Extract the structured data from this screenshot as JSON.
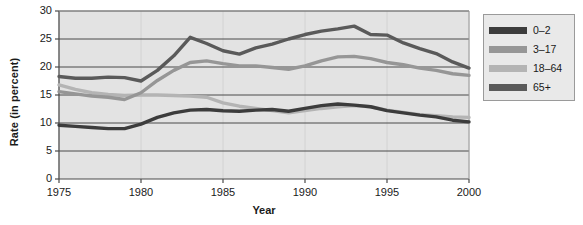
{
  "chart_data": {
    "type": "line",
    "title": "",
    "xlabel": "Year",
    "ylabel": "Rate (in percent)",
    "xlim": [
      1975,
      2000
    ],
    "ylim": [
      0,
      30
    ],
    "xticks": [
      1975,
      1980,
      1985,
      1990,
      1995,
      2000
    ],
    "yticks": [
      0,
      5,
      10,
      15,
      20,
      25,
      30
    ],
    "grid": "horizontal",
    "legend_position": "right",
    "x": [
      1975,
      1976,
      1977,
      1978,
      1979,
      1980,
      1981,
      1982,
      1983,
      1984,
      1985,
      1986,
      1987,
      1988,
      1989,
      1990,
      1991,
      1992,
      1993,
      1994,
      1995,
      1996,
      1997,
      1998,
      1999,
      2000
    ],
    "series": [
      {
        "name": "0-2",
        "color": "#3c3c3c",
        "values": [
          9.6,
          9.4,
          9.2,
          9.0,
          9.0,
          9.8,
          11.0,
          11.8,
          12.3,
          12.4,
          12.2,
          12.1,
          12.3,
          12.4,
          12.1,
          12.6,
          13.1,
          13.4,
          13.2,
          12.9,
          12.2,
          11.8,
          11.4,
          11.1,
          10.5,
          10.2
        ]
      },
      {
        "name": "3-17",
        "color": "#969696",
        "values": [
          15.6,
          15.2,
          14.8,
          14.6,
          14.2,
          15.4,
          17.6,
          19.4,
          20.8,
          21.1,
          20.6,
          20.2,
          20.2,
          19.9,
          19.6,
          20.2,
          21.1,
          21.8,
          21.9,
          21.5,
          20.8,
          20.4,
          19.8,
          19.4,
          18.8,
          18.5
        ]
      },
      {
        "name": "18-64",
        "color": "#b4b4b4",
        "values": [
          16.8,
          16.0,
          15.4,
          15.1,
          14.9,
          15.0,
          15.0,
          14.9,
          14.8,
          14.6,
          13.6,
          13.0,
          12.6,
          12.2,
          11.8,
          12.2,
          12.6,
          12.9,
          13.1,
          12.9,
          12.3,
          11.9,
          11.5,
          11.3,
          11.1,
          11.0
        ]
      },
      {
        "name": "65+",
        "color": "#5a5a5a",
        "values": [
          18.3,
          18.0,
          18.0,
          18.2,
          18.1,
          17.5,
          19.4,
          22.0,
          25.3,
          24.2,
          22.9,
          22.3,
          23.4,
          24.1,
          25.0,
          25.8,
          26.4,
          26.8,
          27.3,
          25.8,
          25.7,
          24.3,
          23.3,
          22.4,
          20.9,
          19.8
        ]
      }
    ]
  },
  "legend": {
    "items": [
      {
        "label": "0–2",
        "color": "#3c3c3c"
      },
      {
        "label": "3–17",
        "color": "#969696"
      },
      {
        "label": "18–64",
        "color": "#b4b4b4"
      },
      {
        "label": "65+",
        "color": "#5a5a5a"
      }
    ]
  },
  "axes": {
    "ylabel": "Rate (in percent)",
    "xlabel": "Year",
    "ytick_labels": [
      "30",
      "25",
      "20",
      "15",
      "10",
      "5",
      "0"
    ],
    "xtick_labels": [
      "1975",
      "1980",
      "1985",
      "1990",
      "1995",
      "2000"
    ]
  },
  "colors": {
    "plot_background": "#e3e3e3",
    "gridline": "#4a4a4a",
    "axis": "#4a4a4a",
    "legend_background": "#e9e9e9",
    "legend_border": "#9a9a9a",
    "page_background": "#ffffff"
  }
}
